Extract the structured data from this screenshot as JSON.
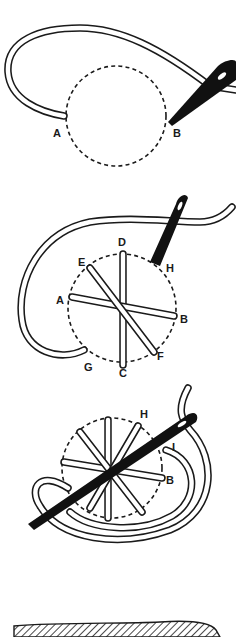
{
  "figure": {
    "colors": {
      "ink": "#1a1a1a",
      "paper": "#ffffff"
    },
    "steps": [
      {
        "id": "step-1",
        "labels": [
          {
            "text": "A",
            "x": 53,
            "y": 137
          },
          {
            "text": "B",
            "x": 173,
            "y": 137
          }
        ]
      },
      {
        "id": "step-2",
        "labels": [
          {
            "text": "D",
            "x": 118,
            "y": 246
          },
          {
            "text": "E",
            "x": 78,
            "y": 266
          },
          {
            "text": "H",
            "x": 166,
            "y": 272
          },
          {
            "text": "A",
            "x": 56,
            "y": 304
          },
          {
            "text": "B",
            "x": 180,
            "y": 323
          },
          {
            "text": "F",
            "x": 157,
            "y": 360
          },
          {
            "text": "G",
            "x": 84,
            "y": 371
          },
          {
            "text": "C",
            "x": 119,
            "y": 377
          }
        ]
      },
      {
        "id": "step-3",
        "labels": [
          {
            "text": "H",
            "x": 140,
            "y": 418
          },
          {
            "text": "I",
            "x": 172,
            "y": 451
          },
          {
            "text": "B",
            "x": 166,
            "y": 484
          }
        ]
      }
    ],
    "bottom_strip": "hatched fabric edge"
  },
  "labels": {
    "s1_a": "A",
    "s1_b": "B",
    "s2_d": "D",
    "s2_e": "E",
    "s2_h": "H",
    "s2_a": "A",
    "s2_b": "B",
    "s2_f": "F",
    "s2_g": "G",
    "s2_c": "C",
    "s3_h": "H",
    "s3_i": "I",
    "s3_b": "B"
  }
}
